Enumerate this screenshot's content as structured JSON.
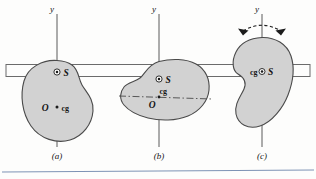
{
  "figure": {
    "axis_label": "y",
    "markers": {
      "suspension_label": "S",
      "origin_label": "O",
      "center_of_gravity_label": "cg"
    },
    "colors": {
      "blob_fill": "#d2d2d2",
      "blob_stroke": "#4a4a4a",
      "axis_stroke": "#5a5a5a",
      "bar_stroke": "#6b6b6b",
      "baseline_rule": "#7e93b5",
      "label_text": "#141414",
      "background": "#fdfdfc"
    },
    "panels": [
      {
        "id": "a",
        "caption": "(a)",
        "axis_label": "y",
        "suspension_label": "S",
        "origin_label": "O",
        "cg_label": "cg",
        "has_rotation_arrow": false,
        "has_dashdot_axis": false
      },
      {
        "id": "b",
        "caption": "(b)",
        "axis_label": "y",
        "suspension_label": "S",
        "origin_label": "O",
        "cg_label": "cg",
        "has_rotation_arrow": false,
        "has_dashdot_axis": true
      },
      {
        "id": "c",
        "caption": "(c)",
        "axis_label": "y",
        "suspension_label": "S",
        "origin_label": "",
        "cg_label": "cg",
        "has_rotation_arrow": true,
        "has_dashdot_axis": false
      }
    ]
  }
}
